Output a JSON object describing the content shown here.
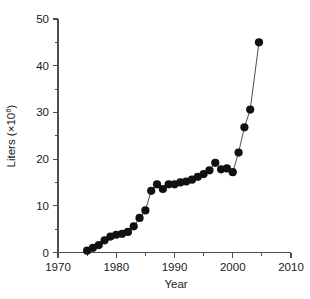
{
  "chart_data": {
    "type": "scatter",
    "title": "",
    "subtitle": "",
    "xlabel": "Year",
    "ylabel": "Liters (×10⁶)",
    "ylabel_base": "Liters (×10",
    "ylabel_exponent": "6",
    "ylabel_close": ")",
    "xlim": [
      1970,
      2010
    ],
    "ylim": [
      0,
      50
    ],
    "xticks": [
      1970,
      1980,
      1990,
      2000,
      2010
    ],
    "xticklabels": [
      "1970",
      "1980",
      "1990",
      "2000",
      "2010"
    ],
    "xminorticks": [
      1975,
      1985,
      1995,
      2005
    ],
    "yticks": [
      0,
      10,
      20,
      30,
      40,
      50
    ],
    "yticklabels": [
      "0",
      "10",
      "20",
      "30",
      "40",
      "50"
    ],
    "yminorticks": [
      5,
      15,
      25,
      35,
      45
    ],
    "grid": false,
    "legend": null,
    "legend_position": "none",
    "marker": "filled-circle",
    "marker_color": "#111111",
    "line_color": "#3a3a3a",
    "axis_color": "#4d4d4d",
    "background_color": "#ffffff",
    "connected": true,
    "x": [
      1975,
      1976,
      1977,
      1978,
      1979,
      1980,
      1981,
      1982,
      1983,
      1984,
      1985,
      1986,
      1987,
      1988,
      1989,
      1990,
      1991,
      1992,
      1993,
      1994,
      1995,
      1996,
      1997,
      1998,
      1999,
      2000,
      2001,
      2002,
      2003,
      2004.5
    ],
    "values": [
      0.4,
      1.0,
      1.6,
      2.6,
      3.4,
      3.8,
      4.0,
      4.4,
      5.6,
      7.4,
      9.0,
      13.2,
      14.6,
      13.6,
      14.6,
      14.6,
      15.0,
      15.2,
      15.6,
      16.2,
      16.8,
      17.6,
      19.2,
      17.8,
      18.0,
      17.2,
      21.4,
      26.8,
      30.6,
      45.0
    ],
    "series": [
      {
        "name": "Liters",
        "x": [
          1975,
          1976,
          1977,
          1978,
          1979,
          1980,
          1981,
          1982,
          1983,
          1984,
          1985,
          1986,
          1987,
          1988,
          1989,
          1990,
          1991,
          1992,
          1993,
          1994,
          1995,
          1996,
          1997,
          1998,
          1999,
          2000,
          2001,
          2002,
          2003,
          2004.5
        ],
        "values": [
          0.4,
          1.0,
          1.6,
          2.6,
          3.4,
          3.8,
          4.0,
          4.4,
          5.6,
          7.4,
          9.0,
          13.2,
          14.6,
          13.6,
          14.6,
          14.6,
          15.0,
          15.2,
          15.6,
          16.2,
          16.8,
          17.6,
          19.2,
          17.8,
          18.0,
          17.2,
          21.4,
          26.8,
          30.6,
          45.0
        ]
      }
    ],
    "annotations": []
  }
}
